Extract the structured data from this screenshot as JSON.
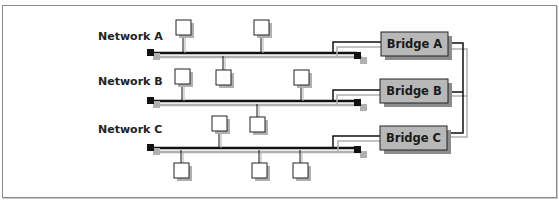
{
  "diagram": {
    "type": "network-bridges",
    "networks": [
      {
        "id": "A",
        "label": "Network A",
        "hosts_above": 2,
        "hosts_below": 0
      },
      {
        "id": "B",
        "label": "Network B",
        "hosts_above": 3,
        "hosts_below": 0
      },
      {
        "id": "C",
        "label": "Network C",
        "hosts_above": 2,
        "hosts_below": 3
      }
    ],
    "bridges": [
      {
        "id": "A",
        "label": "Bridge A",
        "connects": "Network A"
      },
      {
        "id": "B",
        "label": "Bridge B",
        "connects": "Network B"
      },
      {
        "id": "C",
        "label": "Bridge C",
        "connects": "Network C"
      }
    ],
    "interconnect": "Bridges A, B and C joined by a common backbone link",
    "colors": {
      "bus": "#111111",
      "shadow": "#b0b0b0",
      "bridge_fill": "#b8b8b8",
      "host_fill": "#ffffff",
      "terminator": "#111111"
    }
  }
}
